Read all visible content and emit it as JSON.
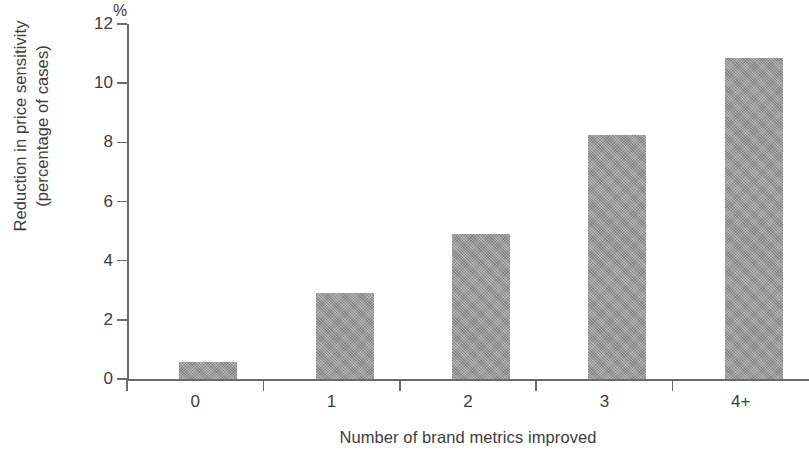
{
  "chart_data": {
    "type": "bar",
    "title": "",
    "subtitle": "",
    "xlabel": "Number of brand metrics improved",
    "ylabel": "Reduction in price sensitivity\n(percentage of cases)",
    "ylabel_lines": [
      "Reduction in price sensitivity",
      "(percentage of cases)"
    ],
    "unit_label": "%",
    "categories": [
      "0",
      "1",
      "2",
      "3",
      "4+"
    ],
    "values": [
      0.57,
      2.9,
      4.9,
      8.25,
      10.85
    ],
    "ylim": [
      0,
      12
    ],
    "ytick_values": [
      0,
      2,
      4,
      6,
      8,
      10,
      12
    ],
    "ytick_labels": [
      "0",
      "2",
      "4",
      "6",
      "8",
      "10",
      "12"
    ],
    "grid": false,
    "legend": null,
    "legend_position": "none",
    "bar_color": "#9b9b9b",
    "axis_color": "#6b6b6b",
    "text_color": "#3d3d3d",
    "background_color": "#ffffff"
  }
}
